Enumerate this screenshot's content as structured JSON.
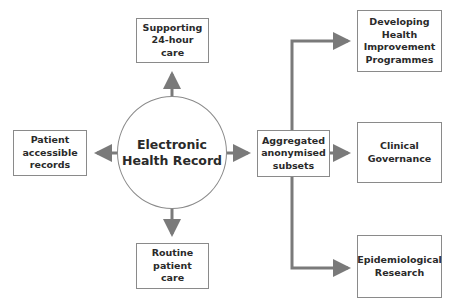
{
  "diagram": {
    "center": {
      "label": "Electronic\nHealth Record"
    },
    "nodes": {
      "top": {
        "label": "Supporting\n24-hour care"
      },
      "left": {
        "label": "Patient\naccessible\nrecords"
      },
      "bottom": {
        "label": "Routine\npatient\ncare"
      },
      "aggregated": {
        "label": "Aggregated\nanonymised\nsubsets"
      },
      "health_programmes": {
        "label": "Developing\nHealth\nImprovement\nProgrammes"
      },
      "clinical_governance": {
        "label": "Clinical\nGovernance"
      },
      "epidemiological": {
        "label": "Epidemiological\nResearch"
      }
    },
    "edges": [
      {
        "from": "Electronic Health Record",
        "to": "Supporting 24-hour care"
      },
      {
        "from": "Electronic Health Record",
        "to": "Patient accessible records"
      },
      {
        "from": "Electronic Health Record",
        "to": "Routine patient care"
      },
      {
        "from": "Electronic Health Record",
        "to": "Aggregated anonymised subsets"
      },
      {
        "from": "Aggregated anonymised subsets",
        "to": "Developing Health Improvement Programmes"
      },
      {
        "from": "Aggregated anonymised subsets",
        "to": "Clinical Governance"
      },
      {
        "from": "Aggregated anonymised subsets",
        "to": "Epidemiological Research"
      }
    ],
    "colors": {
      "arrow": "#7a7a7a",
      "border": "#8a8a8a",
      "text": "#2a2a2a"
    }
  }
}
